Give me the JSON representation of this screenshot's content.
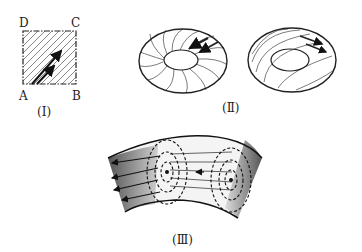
{
  "figure1": {
    "corners": {
      "a": "A",
      "b": "B",
      "c": "C",
      "d": "D"
    },
    "caption": "(Ⅰ)"
  },
  "figure2": {
    "caption": "(Ⅱ)"
  },
  "figure3": {
    "caption": "(Ⅲ)"
  }
}
